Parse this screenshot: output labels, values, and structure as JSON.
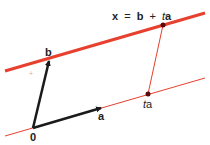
{
  "diagram": {
    "equation": {
      "x": "x",
      "eq": "=",
      "b": "b",
      "plus": "+",
      "t": "t",
      "a": "a"
    },
    "labels": {
      "b": "b",
      "a": "a",
      "origin": "0",
      "ta_t": "t",
      "ta_a": "a",
      "plus_mark": "+"
    },
    "colors": {
      "line": "#e8402e",
      "line_thin": "#e8402e",
      "vector": "#1a1a1a",
      "point": "#5a0a0a",
      "text": "#222222",
      "plus_mark": "#e8a0b0"
    },
    "points": {
      "origin": [
        33,
        128
      ],
      "b": [
        49,
        60
      ],
      "a": [
        101,
        108
      ],
      "ta": [
        148,
        94
      ],
      "x": [
        163,
        25
      ]
    },
    "lines": {
      "through_b": {
        "from": [
          5,
          71
        ],
        "to": [
          205,
          13
        ],
        "thickness": 3
      },
      "through_origin": {
        "from": [
          5,
          136
        ],
        "to": [
          205,
          78
        ],
        "thickness": 1
      }
    }
  }
}
